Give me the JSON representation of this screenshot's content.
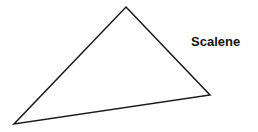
{
  "diagram": {
    "title": "Scalene",
    "shape": "triangle",
    "vertices": [
      [
        126,
        7
      ],
      [
        210,
        95
      ],
      [
        14,
        124
      ]
    ],
    "stroke_color": "#1a1a1a",
    "stroke_width": 1.5,
    "fill": "none"
  }
}
